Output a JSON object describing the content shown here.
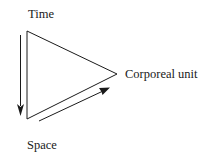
{
  "diagram": {
    "labels": {
      "time": "Time",
      "corporeal_unit": "Corporeal unit",
      "space": "Space"
    },
    "shapes": {
      "triangle": {
        "vertices": [
          [
            27,
            31
          ],
          [
            27,
            119
          ],
          [
            117,
            74
          ]
        ],
        "stroke": "#1a1a1a"
      },
      "time_arrow": {
        "from": [
          20,
          35
        ],
        "to": [
          20,
          116
        ],
        "direction": "down"
      },
      "space_arrow": {
        "from": [
          39,
          121
        ],
        "to": [
          109,
          88
        ],
        "direction": "up-right"
      }
    },
    "colors": {
      "line": "#1a1a1a",
      "background": "#ffffff"
    }
  }
}
